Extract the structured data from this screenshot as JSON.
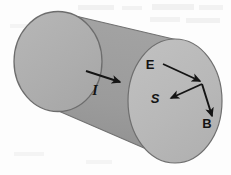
{
  "figure": {
    "background_color": "#fdfdfd",
    "shape": {
      "name": "cylinder",
      "body_color": "#9a9a9a",
      "left_cap_color": "#b0b0b0",
      "right_cap_color": "#b9b9b9",
      "outline_color": "#6e6e6e",
      "orientation": "tilted, axis from lower-left to upper-right"
    },
    "vectors": [
      {
        "id": "current",
        "label": "I",
        "label_style": "serif-bold-italic",
        "label_x": 95,
        "label_y": 95,
        "from_x": 86,
        "from_y": 71,
        "to_x": 123,
        "to_y": 83,
        "description": "current arrow along cylinder surface pointing right"
      },
      {
        "id": "electric-field",
        "label": "E",
        "label_style": "sans-bold",
        "label_x": 150,
        "label_y": 69,
        "from_x": 163,
        "from_y": 64,
        "to_x": 203,
        "to_y": 82,
        "description": "electric field arrow pointing down-right to vertex"
      },
      {
        "id": "poynting-vector",
        "label": "S",
        "label_style": "sans-bold-italic",
        "label_x": 155,
        "label_y": 103,
        "from_x": 202,
        "from_y": 84,
        "to_x": 169,
        "to_y": 99,
        "description": "Poynting vector arrow pointing down-left into cylinder"
      },
      {
        "id": "magnetic-field",
        "label": "B",
        "label_style": "sans-bold",
        "label_x": 207,
        "label_y": 128,
        "from_x": 202,
        "from_y": 84,
        "to_x": 213,
        "to_y": 118,
        "description": "magnetic field arrow pointing down-right"
      }
    ]
  }
}
